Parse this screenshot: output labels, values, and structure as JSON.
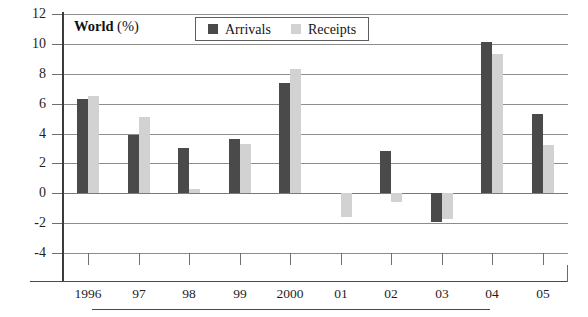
{
  "chart_data": {
    "type": "bar",
    "title": "World (%)",
    "title_name": "World",
    "title_unit": "(%)",
    "xlabel": "",
    "ylabel": "",
    "ylim": [
      -4,
      12
    ],
    "yticks": [
      12,
      10,
      8,
      6,
      4,
      2,
      0,
      -2,
      -4
    ],
    "grid": true,
    "legend_position": "top-center",
    "categories": [
      "1996",
      "97",
      "98",
      "99",
      "2000",
      "01",
      "02",
      "03",
      "04",
      "05"
    ],
    "series": [
      {
        "name": "Arrivals",
        "color": "#4a4a4a",
        "values": [
          6.3,
          3.9,
          3.0,
          3.6,
          7.4,
          0.0,
          2.8,
          -1.9,
          10.1,
          5.3
        ]
      },
      {
        "name": "Receipts",
        "color": "#d2d2d2",
        "values": [
          6.5,
          5.1,
          0.3,
          3.3,
          8.3,
          -1.6,
          -0.6,
          -1.7,
          9.3,
          3.2
        ]
      }
    ]
  }
}
